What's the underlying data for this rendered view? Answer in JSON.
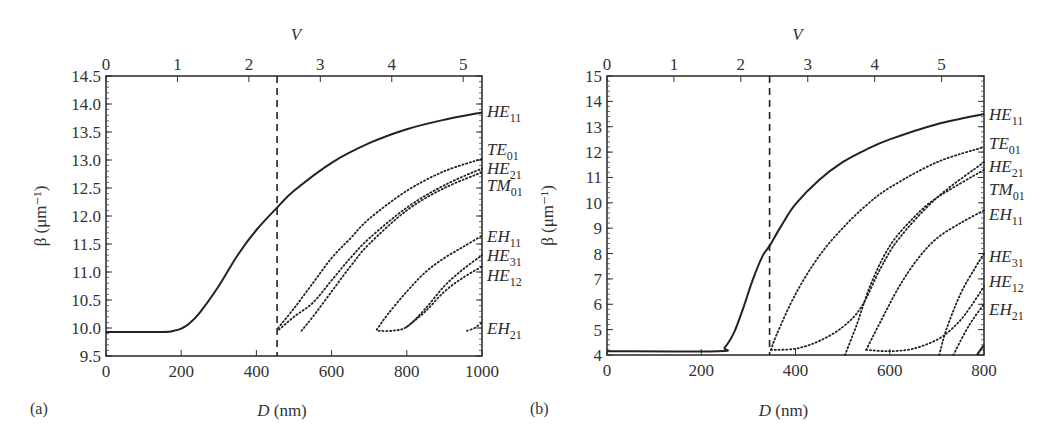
{
  "chart_data": [
    {
      "id": "a",
      "type": "line",
      "panel_label": "(a)",
      "title": "",
      "xlabel_italic": "D",
      "xlabel_unit": " (nm)",
      "ylabel": "β (μm⁻¹)",
      "top_xlabel": "V",
      "xlim": [
        0,
        1000
      ],
      "ylim": [
        9.5,
        14.5
      ],
      "x_ticks": [
        0,
        200,
        400,
        600,
        800,
        1000
      ],
      "y_ticks": [
        "9.5",
        "10.0",
        "10.5",
        "11.0",
        "11.5",
        "12.0",
        "12.5",
        "13.0",
        "13.5",
        "14.0",
        "14.5"
      ],
      "top_ticks": [
        0,
        1,
        2,
        3,
        4,
        5
      ],
      "top_tick_D": [
        0,
        190,
        380,
        570,
        760,
        950
      ],
      "cutoff_line_D": 455,
      "grid": false,
      "series": [
        {
          "name": "HE11",
          "style": "solid",
          "x": [
            0,
            150,
            180,
            200,
            220,
            250,
            300,
            350,
            400,
            455,
            500,
            600,
            700,
            800,
            900,
            1000
          ],
          "y": [
            9.93,
            9.93,
            9.95,
            9.99,
            10.07,
            10.28,
            10.75,
            11.3,
            11.75,
            12.15,
            12.45,
            12.95,
            13.3,
            13.55,
            13.72,
            13.85
          ]
        },
        {
          "name": "TE01",
          "style": "dotted",
          "x": [
            458,
            500,
            550,
            600,
            650,
            700,
            800,
            900,
            1000
          ],
          "y": [
            10.0,
            10.35,
            10.8,
            11.25,
            11.6,
            11.95,
            12.45,
            12.8,
            13.02
          ]
        },
        {
          "name": "HE21",
          "style": "dotted",
          "x": [
            460,
            500,
            550,
            600,
            650,
            700,
            800,
            900,
            1000
          ],
          "y": [
            9.97,
            10.2,
            10.45,
            10.85,
            11.25,
            11.6,
            12.15,
            12.55,
            12.85
          ]
        },
        {
          "name": "TM01",
          "style": "dotted",
          "x": [
            520,
            550,
            600,
            650,
            700,
            800,
            900,
            1000
          ],
          "y": [
            9.95,
            10.2,
            10.65,
            11.1,
            11.5,
            12.1,
            12.5,
            12.78
          ]
        },
        {
          "name": "EH11",
          "style": "dotted",
          "x": [
            720,
            750,
            800,
            850,
            900,
            950,
            1000
          ],
          "y": [
            9.97,
            10.25,
            10.65,
            11.0,
            11.25,
            11.45,
            11.65
          ]
        },
        {
          "name": "HE31",
          "style": "dotted",
          "x": [
            725,
            760,
            800,
            850,
            900,
            950,
            1000
          ],
          "y": [
            9.95,
            9.95,
            10.02,
            10.35,
            10.75,
            11.05,
            11.3
          ]
        },
        {
          "name": "HE12",
          "style": "dotted",
          "x": [
            800,
            850,
            900,
            950,
            1000
          ],
          "y": [
            10.02,
            10.3,
            10.65,
            10.9,
            11.1
          ]
        },
        {
          "name": "EH21",
          "style": "dotted",
          "x": [
            960,
            980,
            1000
          ],
          "y": [
            9.95,
            10.0,
            10.1
          ]
        }
      ],
      "mode_labels": [
        {
          "base": "HE",
          "sub": "11",
          "y": 13.88
        },
        {
          "base": "TE",
          "sub": "01",
          "y": 13.2
        },
        {
          "base": "HE",
          "sub": "21",
          "y": 12.85
        },
        {
          "base": "TM",
          "sub": "01",
          "y": 12.55
        },
        {
          "base": "EH",
          "sub": "11",
          "y": 11.65
        },
        {
          "base": "HE",
          "sub": "31",
          "y": 11.3
        },
        {
          "base": "HE",
          "sub": "12",
          "y": 10.95
        },
        {
          "base": "EH",
          "sub": "21",
          "y": 10.0
        }
      ]
    },
    {
      "id": "b",
      "type": "line",
      "panel_label": "(b)",
      "title": "",
      "xlabel_italic": "D",
      "xlabel_unit": " (nm)",
      "ylabel": "β (μm⁻¹)",
      "top_xlabel": "V",
      "xlim": [
        0,
        800
      ],
      "ylim": [
        4,
        15
      ],
      "x_ticks": [
        0,
        200,
        400,
        600,
        800
      ],
      "y_ticks": [
        "4",
        "5",
        "6",
        "7",
        "8",
        "9",
        "10",
        "11",
        "12",
        "13",
        "14",
        "15"
      ],
      "top_ticks": [
        0,
        1,
        2,
        3,
        4,
        5
      ],
      "top_tick_D": [
        0,
        142,
        284,
        426,
        568,
        710
      ],
      "cutoff_line_D": 345,
      "grid": false,
      "series": [
        {
          "name": "HE11",
          "style": "solid",
          "x": [
            0,
            235,
            250,
            270,
            290,
            310,
            330,
            345,
            370,
            400,
            450,
            500,
            550,
            600,
            700,
            800
          ],
          "y": [
            4.15,
            4.15,
            4.3,
            4.9,
            5.9,
            7.0,
            7.9,
            8.3,
            9.1,
            9.95,
            10.9,
            11.6,
            12.1,
            12.5,
            13.1,
            13.5
          ]
        },
        {
          "name": "TE01",
          "style": "dotted",
          "x": [
            348,
            360,
            400,
            450,
            500,
            550,
            600,
            700,
            800
          ],
          "y": [
            4.2,
            4.8,
            6.4,
            7.9,
            9.0,
            9.9,
            10.6,
            11.6,
            12.2
          ]
        },
        {
          "name": "HE21",
          "style": "dotted",
          "x": [
            348,
            400,
            450,
            500,
            540,
            580,
            620,
            700,
            800
          ],
          "y": [
            4.2,
            4.25,
            4.55,
            5.1,
            5.9,
            7.4,
            8.6,
            10.2,
            11.6
          ]
        },
        {
          "name": "TM01",
          "style": "dotted",
          "x": [
            505,
            530,
            560,
            600,
            650,
            700,
            800
          ],
          "y": [
            4.0,
            5.2,
            6.8,
            8.3,
            9.4,
            10.2,
            11.3
          ]
        },
        {
          "name": "EH11",
          "style": "dotted",
          "x": [
            550,
            580,
            620,
            660,
            700,
            750,
            800
          ],
          "y": [
            4.2,
            5.3,
            6.7,
            7.8,
            8.6,
            9.2,
            9.7
          ]
        },
        {
          "name": "HE31",
          "style": "dotted",
          "x": [
            550,
            600,
            650,
            700,
            730,
            760,
            800
          ],
          "y": [
            4.2,
            4.15,
            4.25,
            4.6,
            5.0,
            5.6,
            6.7
          ]
        },
        {
          "name": "HE12",
          "style": "dotted",
          "x": [
            705,
            720,
            750,
            780,
            800
          ],
          "y": [
            4.0,
            5.0,
            6.4,
            7.4,
            8.0
          ]
        },
        {
          "name": "EH21",
          "style": "dotted",
          "x": [
            735,
            760,
            780,
            800
          ],
          "y": [
            4.0,
            4.9,
            5.5,
            6.0
          ]
        },
        {
          "name": "HE22",
          "style": "solid",
          "x": [
            785,
            800
          ],
          "y": [
            4.0,
            4.4
          ]
        }
      ],
      "mode_labels": [
        {
          "base": "HE",
          "sub": "11",
          "y": 13.5
        },
        {
          "base": "TE",
          "sub": "01",
          "y": 12.35
        },
        {
          "base": "HE",
          "sub": "21",
          "y": 11.45
        },
        {
          "base": "TM",
          "sub": "01",
          "y": 10.55
        },
        {
          "base": "EH",
          "sub": "11",
          "y": 9.55
        },
        {
          "base": "HE",
          "sub": "31",
          "y": 7.9
        },
        {
          "base": "HE",
          "sub": "12",
          "y": 6.9
        },
        {
          "base": "EH",
          "sub": "21",
          "y": 5.8
        }
      ]
    }
  ]
}
